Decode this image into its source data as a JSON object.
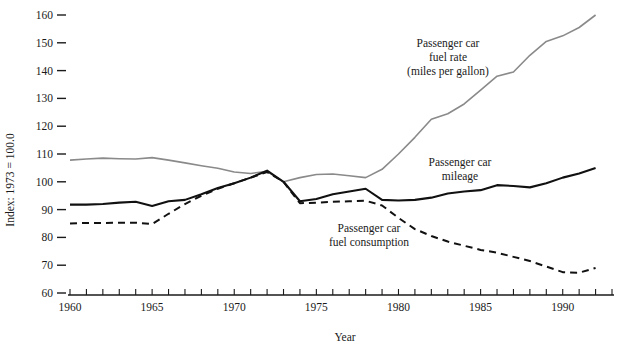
{
  "chart_data": {
    "type": "line",
    "title": "",
    "xlabel": "Year",
    "ylabel": "Index: 1973 = 100.0",
    "xlim": [
      1960,
      1993
    ],
    "ylim": [
      60,
      163
    ],
    "grid": false,
    "legend_position": "inline-annotations",
    "x_ticks": [
      1960,
      1961,
      1962,
      1963,
      1964,
      1965,
      1966,
      1967,
      1968,
      1969,
      1970,
      1971,
      1972,
      1973,
      1974,
      1975,
      1976,
      1977,
      1978,
      1979,
      1980,
      1981,
      1982,
      1983,
      1984,
      1985,
      1986,
      1987,
      1988,
      1989,
      1990,
      1991,
      1992,
      1993
    ],
    "x_tick_labels": [
      "1960",
      "1965",
      "1970",
      "1975",
      "1980",
      "1985",
      "1990"
    ],
    "x_tick_label_values": [
      1960,
      1965,
      1970,
      1975,
      1980,
      1985,
      1990
    ],
    "y_ticks": [
      60,
      70,
      80,
      90,
      100,
      110,
      120,
      130,
      140,
      150,
      160
    ],
    "y_tick_labels": [
      "60",
      "70",
      "80",
      "90",
      "100",
      "110",
      "120",
      "130",
      "140",
      "150",
      "160"
    ],
    "x": [
      1960,
      1961,
      1962,
      1963,
      1964,
      1965,
      1966,
      1967,
      1968,
      1969,
      1970,
      1971,
      1972,
      1973,
      1974,
      1975,
      1976,
      1977,
      1978,
      1979,
      1980,
      1981,
      1982,
      1983,
      1984,
      1985,
      1986,
      1987,
      1988,
      1989,
      1990,
      1991,
      1992
    ],
    "series": [
      {
        "name": "Passenger car fuel rate (miles per gallon)",
        "style": "solid-gray",
        "color": "#8a8a8a",
        "values": [
          107.8,
          108.2,
          108.5,
          108.3,
          108.2,
          108.7,
          107.8,
          106.8,
          105.8,
          104.9,
          103.5,
          103.0,
          103.8,
          100.0,
          101.5,
          102.6,
          102.8,
          102.2,
          101.5,
          104.5,
          110.0,
          116.0,
          122.5,
          124.5,
          128.0,
          133.0,
          138.0,
          139.5,
          145.5,
          150.5,
          152.5,
          155.5,
          160.0
        ]
      },
      {
        "name": "Passenger car mileage",
        "style": "solid-black",
        "color": "#111111",
        "values": [
          91.8,
          91.8,
          92.0,
          92.5,
          92.8,
          91.3,
          93.0,
          93.5,
          95.5,
          97.8,
          99.5,
          101.5,
          104.0,
          100.0,
          93.0,
          93.8,
          95.5,
          96.5,
          97.5,
          93.5,
          93.3,
          93.5,
          94.3,
          95.8,
          96.5,
          97.0,
          98.8,
          98.5,
          98.0,
          99.5,
          101.5,
          103.0,
          105.0
        ]
      },
      {
        "name": "Passenger car fuel consumption",
        "style": "dashed-black",
        "color": "#111111",
        "values": [
          85.0,
          85.2,
          85.2,
          85.3,
          85.3,
          84.8,
          88.5,
          92.0,
          95.0,
          97.5,
          99.5,
          101.5,
          103.5,
          100.0,
          92.3,
          92.5,
          92.8,
          93.0,
          93.2,
          91.5,
          87.0,
          83.0,
          80.5,
          78.5,
          77.0,
          75.5,
          74.5,
          73.0,
          71.5,
          69.5,
          67.5,
          67.3,
          69.0
        ]
      }
    ],
    "annotations": [
      {
        "id": "fuel-rate-label",
        "lines": [
          "Passenger car",
          "fuel rate",
          "(miles per gallon)"
        ],
        "x_px": 448,
        "y_px": 47
      },
      {
        "id": "mileage-label",
        "lines": [
          "Passenger car",
          "mileage"
        ],
        "x_px": 460,
        "y_px": 166
      },
      {
        "id": "fuel-consumption-label",
        "lines": [
          "Passenger car",
          "fuel consumption"
        ],
        "x_px": 369,
        "y_px": 232
      }
    ]
  }
}
